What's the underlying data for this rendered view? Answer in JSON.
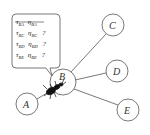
{
  "diagram": {
    "nodes": [
      {
        "id": "A",
        "label": "A"
      },
      {
        "id": "B",
        "label": "B"
      },
      {
        "id": "C",
        "label": "C"
      },
      {
        "id": "D",
        "label": "D"
      },
      {
        "id": "E",
        "label": "E"
      }
    ],
    "edges": [
      {
        "from": "A",
        "to": "B"
      },
      {
        "from": "B",
        "to": "C"
      },
      {
        "from": "B",
        "to": "D"
      },
      {
        "from": "B",
        "to": "E"
      }
    ],
    "callout": {
      "rows": [
        {
          "tau": "τ",
          "tau_sub": "BA",
          "eta": "η",
          "eta_sub": "BA",
          "mark": "",
          "struck": true
        },
        {
          "tau": "τ",
          "tau_sub": "BC",
          "eta": "η",
          "eta_sub": "BC",
          "mark": "?",
          "struck": false
        },
        {
          "tau": "τ",
          "tau_sub": "BD",
          "eta": "η",
          "eta_sub": "BD",
          "mark": "?",
          "struck": false
        },
        {
          "tau": "τ",
          "tau_sub": "BE",
          "eta": "η",
          "eta_sub": "BE",
          "mark": "?",
          "struck": false
        }
      ]
    },
    "ant": {
      "position": "B",
      "icon": "ant-icon"
    }
  }
}
